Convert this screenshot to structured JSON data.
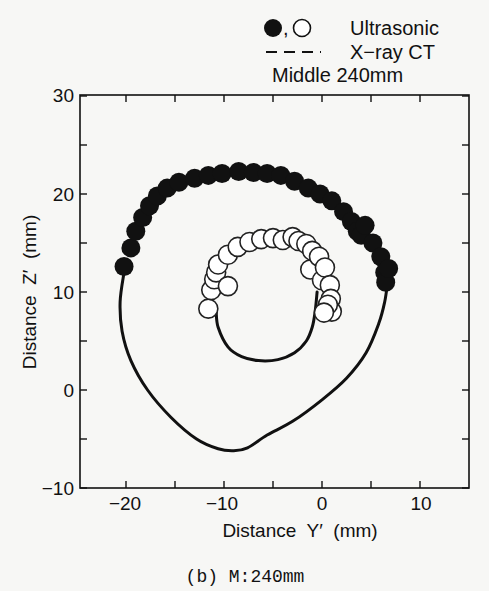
{
  "legend": {
    "markers_label": "Ultrasonic",
    "line_label": "X−ray CT",
    "section_label": "Middle 240mm"
  },
  "axes": {
    "xlabel": "Distance  Y′  (mm)",
    "ylabel": "Distance  Z′  (mm)",
    "xticks": [
      "−20",
      "−10",
      "0",
      "10"
    ],
    "yticks": [
      "30",
      "20",
      "10",
      "0",
      "−10"
    ]
  },
  "caption": "(b) M:240mm",
  "colors": {
    "ink": "#111111",
    "background": "#f7f7f5",
    "open_marker_fill": "#ffffff"
  },
  "chart_data": {
    "type": "scatter",
    "title": "Middle 240mm",
    "xlabel": "Distance Y′ (mm)",
    "ylabel": "Distance Z′ (mm)",
    "xlim": [
      -24.5,
      15
    ],
    "ylim": [
      -10,
      30
    ],
    "xticks": [
      -20,
      -10,
      0,
      10
    ],
    "yticks": [
      -10,
      0,
      10,
      20,
      30
    ],
    "minor_xticks": [
      -15,
      -5,
      5
    ],
    "minor_yticks": [
      -5,
      5,
      15,
      25
    ],
    "grid": false,
    "legend_position": "top-right outside",
    "caption": "(b) M:240mm",
    "series": [
      {
        "name": "Ultrasonic (outer surface)",
        "marker": "filled-circle",
        "points": [
          [
            -20.2,
            12.6
          ],
          [
            -19.5,
            14.5
          ],
          [
            -19.0,
            16.2
          ],
          [
            -18.3,
            17.6
          ],
          [
            -17.6,
            18.8
          ],
          [
            -16.8,
            19.8
          ],
          [
            -15.8,
            20.6
          ],
          [
            -14.6,
            21.2
          ],
          [
            -13.0,
            21.6
          ],
          [
            -11.6,
            21.9
          ],
          [
            -10.2,
            22.1
          ],
          [
            -8.5,
            22.3
          ],
          [
            -7.0,
            22.2
          ],
          [
            -5.6,
            22.1
          ],
          [
            -4.2,
            21.9
          ],
          [
            -2.8,
            21.3
          ],
          [
            -1.4,
            20.6
          ],
          [
            -0.2,
            20.0
          ],
          [
            1.0,
            19.3
          ],
          [
            2.2,
            18.2
          ],
          [
            3.0,
            17.2
          ],
          [
            3.6,
            16.2
          ],
          [
            4.0,
            15.8
          ],
          [
            4.4,
            16.8
          ],
          [
            5.2,
            15.0
          ],
          [
            6.0,
            13.6
          ],
          [
            6.4,
            12.0
          ],
          [
            6.5,
            11.0
          ],
          [
            6.8,
            12.4
          ]
        ]
      },
      {
        "name": "Ultrasonic (inner surface)",
        "marker": "open-circle",
        "points": [
          [
            -11.6,
            8.3
          ],
          [
            -11.3,
            10.2
          ],
          [
            -11.0,
            11.3
          ],
          [
            -10.8,
            12.0
          ],
          [
            -10.6,
            12.8
          ],
          [
            -9.6,
            10.6
          ],
          [
            -9.6,
            13.8
          ],
          [
            -8.6,
            14.6
          ],
          [
            -7.4,
            15.1
          ],
          [
            -6.2,
            15.4
          ],
          [
            -5.0,
            15.5
          ],
          [
            -4.0,
            15.3
          ],
          [
            -3.0,
            15.6
          ],
          [
            -2.4,
            15.2
          ],
          [
            -1.6,
            14.9
          ],
          [
            -1.2,
            12.3
          ],
          [
            -1.0,
            14.2
          ],
          [
            -0.3,
            13.6
          ],
          [
            0.0,
            11.2
          ],
          [
            0.3,
            12.5
          ],
          [
            0.8,
            10.7
          ],
          [
            0.9,
            9.3
          ],
          [
            1.0,
            8.0
          ],
          [
            0.6,
            8.7
          ],
          [
            0.2,
            7.9
          ]
        ]
      },
      {
        "name": "X-ray CT (outer contour)",
        "line": "solid",
        "points": [
          [
            -20.2,
            12.0
          ],
          [
            -20.6,
            9.0
          ],
          [
            -20.4,
            6.0
          ],
          [
            -19.5,
            3.0
          ],
          [
            -17.8,
            0.0
          ],
          [
            -15.4,
            -2.8
          ],
          [
            -12.8,
            -5.0
          ],
          [
            -10.6,
            -6.0
          ],
          [
            -9.0,
            -6.2
          ],
          [
            -7.6,
            -5.9
          ],
          [
            -5.6,
            -4.6
          ],
          [
            -3.0,
            -3.2
          ],
          [
            0.0,
            -1.0
          ],
          [
            2.5,
            1.2
          ],
          [
            4.5,
            3.8
          ],
          [
            5.8,
            6.8
          ],
          [
            6.4,
            9.0
          ],
          [
            6.7,
            11.0
          ]
        ]
      },
      {
        "name": "X-ray CT (inner contour)",
        "line": "solid",
        "points": [
          [
            -10.8,
            8.0
          ],
          [
            -10.6,
            6.4
          ],
          [
            -9.6,
            4.4
          ],
          [
            -8.2,
            3.4
          ],
          [
            -6.5,
            3.0
          ],
          [
            -4.5,
            3.1
          ],
          [
            -2.8,
            3.8
          ],
          [
            -1.6,
            5.0
          ],
          [
            -1.0,
            6.4
          ],
          [
            -0.7,
            8.0
          ],
          [
            -0.5,
            10.0
          ]
        ]
      }
    ]
  }
}
